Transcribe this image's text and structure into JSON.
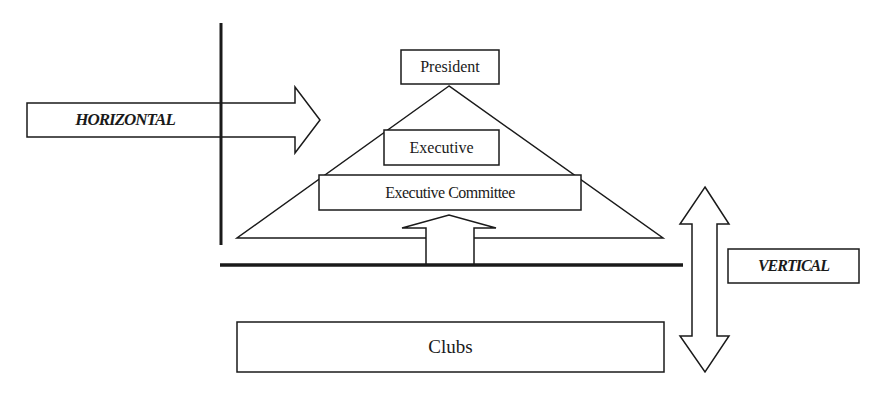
{
  "diagram": {
    "labels": {
      "president": "President",
      "executive": "Executive",
      "executive_committee": "Executive Committee",
      "clubs": "Clubs",
      "horizontal": "HORIZONTAL",
      "vertical": "VERTICAL"
    },
    "colors": {
      "stroke": "#1a1a1a",
      "fill": "#ffffff"
    }
  }
}
